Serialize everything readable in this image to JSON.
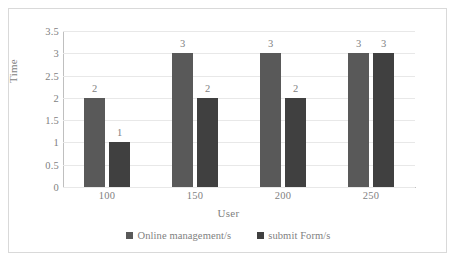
{
  "chart_data": {
    "type": "bar",
    "title": "",
    "xlabel": "User",
    "ylabel": "Time",
    "categories": [
      "100",
      "150",
      "200",
      "250"
    ],
    "series": [
      {
        "name": "Online management/s",
        "color": "#595959",
        "values": [
          2,
          3,
          3,
          3
        ],
        "labels": [
          "2",
          "3",
          "3",
          "3"
        ]
      },
      {
        "name": "submit Form/s",
        "color": "#404040",
        "values": [
          1,
          2,
          2,
          3
        ],
        "labels": [
          "1",
          "2",
          "2",
          "3"
        ]
      }
    ],
    "ylim": [
      0,
      3.5
    ],
    "ytick_values": [
      0,
      0.5,
      1,
      1.5,
      2,
      2.5,
      3,
      3.5
    ],
    "ytick_labels": [
      "0",
      "0.5",
      "1",
      "1.5",
      "2",
      "2.5",
      "3",
      "3.5"
    ],
    "grid": true,
    "grid_axis": "y",
    "legend_position": "bottom",
    "data_labels": true,
    "plot_background": "#ffffff",
    "frame_border_color": "#d9d9d9",
    "axis_color": "#bfbfbf",
    "gridline_color": "#e8e8e8",
    "text_color": "#7f7f7f"
  }
}
